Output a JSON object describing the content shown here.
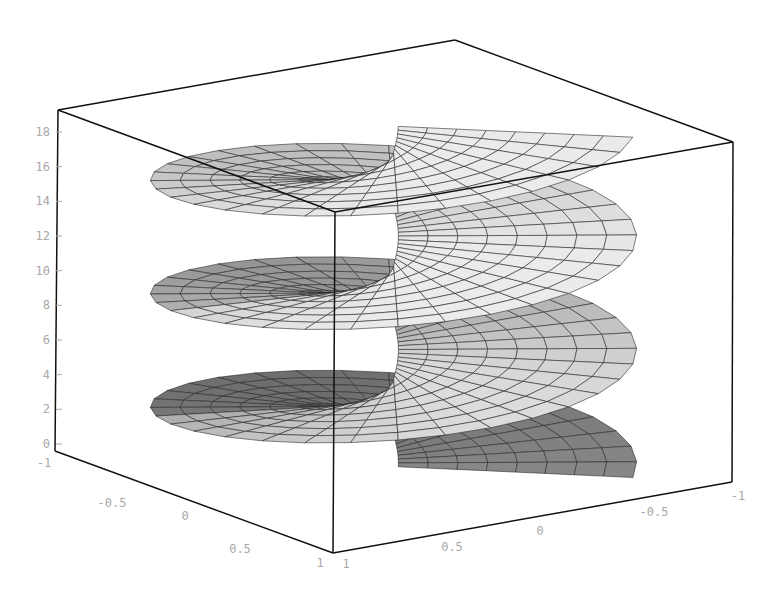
{
  "chart_data": {
    "type": "surface3d",
    "title": "",
    "title_note": "title text cropped at top edge of image (only descenders visible)",
    "surface": "helicoid (spiral ramp), x = u*cos(t), y = u*sin(t), z = t, ~3 turns",
    "x_axis": {
      "label": "",
      "ticks": [
        "1",
        "0.5",
        "0",
        "-0.5",
        "-1"
      ],
      "range": [
        -1,
        1
      ]
    },
    "y_axis": {
      "label": "",
      "ticks": [
        "-1",
        "-0.5",
        "0",
        "0.5",
        "1"
      ],
      "range": [
        -1,
        1
      ]
    },
    "z_axis": {
      "label": "",
      "ticks": [
        "0",
        "2",
        "4",
        "6",
        "8",
        "10",
        "12",
        "14",
        "16",
        "18"
      ],
      "range": [
        0,
        19
      ]
    },
    "box": true,
    "grid": false,
    "legend": null,
    "shading": {
      "dark": "#6a6a6a",
      "mid": "#a9a9a9",
      "light": "#e6e6e6",
      "edge": "#202020",
      "box": "#111111",
      "tick_label": "#a8a8a8"
    }
  }
}
